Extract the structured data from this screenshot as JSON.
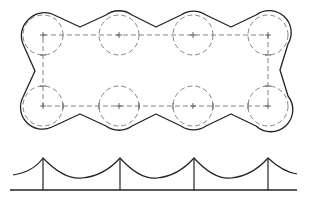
{
  "diagram": {
    "type": "technical-drawing",
    "colors": {
      "outline": "#222222",
      "construction": "#777777",
      "background": "#ffffff"
    },
    "top_view": {
      "description": "Scalloped outer boundary enveloping a 4x2 grid of dashed circles connected by a dashed rectangle",
      "circle_radius": 20,
      "column_centers_x": [
        43,
        119,
        193,
        268
      ],
      "row_centers_y": [
        35,
        106
      ],
      "circles": [
        {
          "cx": 43,
          "cy": 35
        },
        {
          "cx": 119,
          "cy": 35
        },
        {
          "cx": 193,
          "cy": 35
        },
        {
          "cx": 268,
          "cy": 35
        },
        {
          "cx": 43,
          "cy": 106
        },
        {
          "cx": 119,
          "cy": 106
        },
        {
          "cx": 193,
          "cy": 106
        },
        {
          "cx": 268,
          "cy": 106
        }
      ],
      "dashed_rectangle": {
        "x1": 43,
        "y1": 35,
        "x2": 268,
        "y2": 106
      }
    },
    "side_view": {
      "description": "Catenary-like cable profile hanging between four vertical posts above a baseline",
      "baseline_y": 190,
      "baseline_x": [
        10,
        297
      ],
      "post_x": [
        43,
        120,
        194,
        268
      ],
      "peak_y": 158,
      "valley_y": 178,
      "end_points": [
        {
          "x": 13,
          "y": 175
        },
        {
          "x": 297,
          "y": 174
        }
      ]
    }
  }
}
